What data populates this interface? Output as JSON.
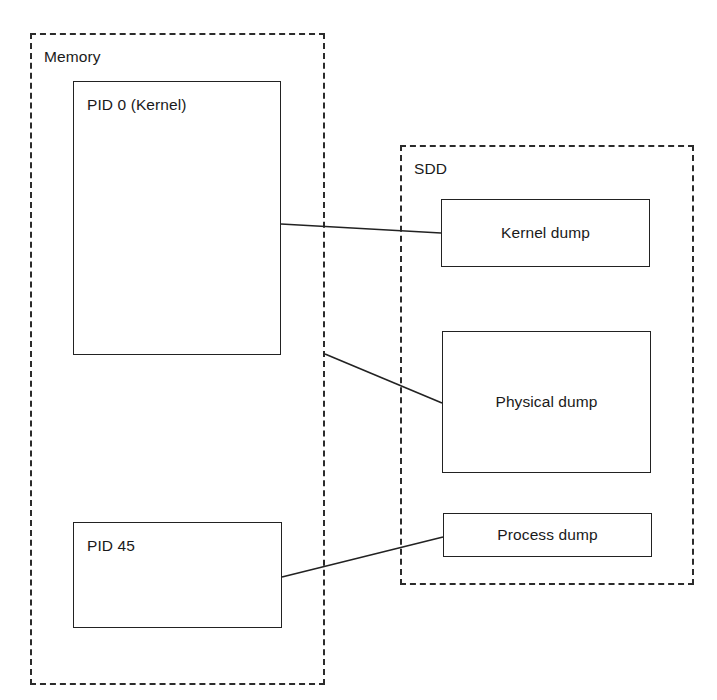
{
  "diagram": {
    "canvas": {
      "width": 717,
      "height": 700,
      "background": "#ffffff"
    },
    "stroke_color": "#222222",
    "text_color": "#1a1a1a",
    "groups": [
      {
        "id": "memory",
        "label": "Memory",
        "style": "dashed",
        "x": 30,
        "y": 33,
        "width": 295,
        "height": 652
      },
      {
        "id": "sdd",
        "label": "SDD",
        "style": "dashed",
        "x": 400,
        "y": 145,
        "width": 294,
        "height": 440
      }
    ],
    "nodes": [
      {
        "id": "pid0",
        "label": "PID 0 (Kernel)",
        "group": "memory",
        "label_align": "top-left",
        "x": 73,
        "y": 81,
        "width": 208,
        "height": 274
      },
      {
        "id": "pid45",
        "label": "PID 45",
        "group": "memory",
        "label_align": "top-left",
        "x": 73,
        "y": 522,
        "width": 209,
        "height": 106
      },
      {
        "id": "kernel_dump",
        "label": "Kernel dump",
        "group": "sdd",
        "label_align": "center",
        "x": 441,
        "y": 199,
        "width": 209,
        "height": 68
      },
      {
        "id": "physical_dump",
        "label": "Physical dump",
        "group": "sdd",
        "label_align": "center",
        "x": 442,
        "y": 331,
        "width": 209,
        "height": 142
      },
      {
        "id": "process_dump",
        "label": "Process dump",
        "group": "sdd",
        "label_align": "center",
        "x": 443,
        "y": 513,
        "width": 209,
        "height": 44
      }
    ],
    "connectors": [
      {
        "id": "pid0-to-kernel-dump",
        "from": "pid0",
        "to": "kernel_dump",
        "x1": 281,
        "y1": 224,
        "x2": 441,
        "y2": 233
      },
      {
        "id": "memory-to-physical-dump",
        "from": "memory",
        "to": "physical_dump",
        "x1": 325,
        "y1": 354,
        "x2": 442,
        "y2": 403
      },
      {
        "id": "pid45-to-process-dump",
        "from": "pid45",
        "to": "process_dump",
        "x1": 282,
        "y1": 577,
        "x2": 443,
        "y2": 537
      }
    ]
  }
}
